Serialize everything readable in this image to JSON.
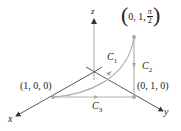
{
  "diagram": {
    "axes": {
      "x_label": "x",
      "y_label": "y",
      "z_label": "z"
    },
    "points": {
      "p100": "(1, 0, 0)",
      "p010": "(0, 1, 0)",
      "ptop_prefix": "0, 1, ",
      "ptop_num": "π",
      "ptop_den": "2"
    },
    "curves": {
      "c1": "C",
      "c1_sub": "1",
      "c2": "C",
      "c2_sub": "2",
      "c3": "C",
      "c3_sub": "3"
    },
    "colors": {
      "axis": "#333333",
      "curve": "#b0b0b0"
    }
  }
}
